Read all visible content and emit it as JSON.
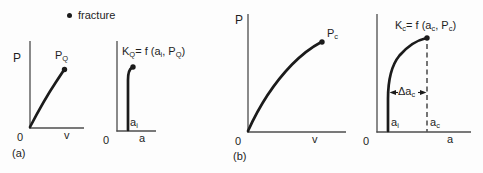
{
  "figure": {
    "legend": {
      "label": "fracture"
    },
    "panel_a": {
      "tag": "(a)",
      "pv": {
        "y_label": "P",
        "x_label": "v",
        "origin": "0",
        "point_main": "P",
        "point_sub": "Q"
      },
      "kq": {
        "title_p1": "K",
        "title_s1": "Q",
        "title_p2": "= f (a",
        "title_s2": "i",
        "title_p3": ", P",
        "title_s3": "Q",
        "title_p4": ")",
        "x_label": "a",
        "origin": "0",
        "ai_main": "a",
        "ai_sub": "i"
      }
    },
    "panel_b": {
      "tag": "(b)",
      "pv": {
        "y_label": "P",
        "x_label": "v",
        "origin": "0",
        "point_main": "P",
        "point_sub": "c"
      },
      "kc": {
        "title_p1": "K",
        "title_s1": "c",
        "title_p2": "= f (a",
        "title_s2": "c",
        "title_p3": ", P",
        "title_s3": "c",
        "title_p4": ")",
        "x_label": "a",
        "origin": "0",
        "ai_main": "a",
        "ai_sub": "i",
        "ac_main": "a",
        "ac_sub": "c",
        "delta_main": "Δa",
        "delta_sub": "c"
      }
    },
    "colors": {
      "ink": "#1b1b1b",
      "axis": "#4d4d4d",
      "background": "#fdfdfd"
    }
  }
}
